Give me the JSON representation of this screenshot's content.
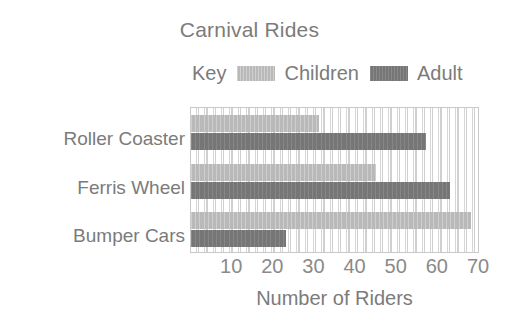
{
  "chart_data": {
    "type": "bar",
    "orientation": "horizontal",
    "title": "Carnival Rides",
    "xlabel": "Number of Riders",
    "ylabel": "",
    "categories": [
      "Roller Coaster",
      "Ferris Wheel",
      "Bumper Cars"
    ],
    "series": [
      {
        "name": "Children",
        "color": "#b9b9b9",
        "values": [
          31,
          45,
          68
        ]
      },
      {
        "name": "Adult",
        "color": "#767676",
        "values": [
          57,
          63,
          23
        ]
      }
    ],
    "xlim": [
      0,
      70
    ],
    "xticks": [
      10,
      20,
      30,
      40,
      50,
      60,
      70
    ],
    "xtick_labels": [
      "10",
      "20",
      "30",
      "40",
      "50",
      "60",
      "70"
    ],
    "grid": true,
    "grid_axis": "x",
    "grid_interval": 2,
    "legend_title": "Key",
    "legend_position": "top",
    "legend_entries": [
      "Children",
      "Adult"
    ]
  },
  "legend": {
    "key_label": "Key",
    "items": [
      {
        "label": "Children",
        "swatch": "children-swatch"
      },
      {
        "label": "Adult",
        "swatch": "adult-swatch"
      }
    ]
  },
  "colors": {
    "children": "#b9b9b9",
    "adult": "#767676",
    "text": "#7b7b7b",
    "axis": "#c9c9c9",
    "grid": "#d3d3d3",
    "background": "#ffffff"
  }
}
